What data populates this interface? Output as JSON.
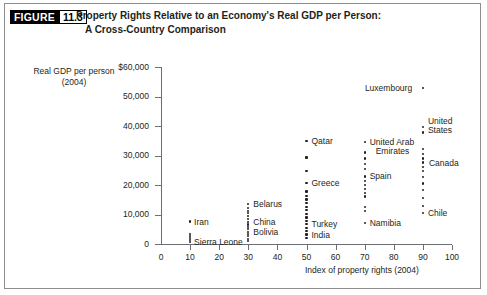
{
  "figure": {
    "tag_word": "FIGURE",
    "tag_number": "11.3",
    "title_line1": "Property Rights Relative to an Economy's Real GDP per Person:",
    "title_line2": "A Cross-Country Comparison"
  },
  "chart_data": {
    "type": "scatter",
    "title": "Property Rights Relative to an Economy's Real GDP per Person: A Cross-Country Comparison",
    "xlabel": "Index of property rights (2004)",
    "ylabel": "Real GDP per person (2004)",
    "xlim": [
      0,
      100
    ],
    "ylim": [
      0,
      60000
    ],
    "grid": false,
    "legend": "none",
    "xticks": [
      "0",
      "10",
      "20",
      "30",
      "40",
      "50",
      "60",
      "70",
      "80",
      "90",
      "100"
    ],
    "yticks": [
      "$60,000",
      "50,000",
      "40,000",
      "30,000",
      "20,000",
      "10,000",
      "0"
    ],
    "ytick_values": [
      60000,
      50000,
      40000,
      30000,
      20000,
      10000,
      0
    ],
    "xtick_values": [
      0,
      10,
      20,
      30,
      40,
      50,
      60,
      70,
      80,
      90,
      100
    ],
    "annotations": [
      {
        "label": "Iran",
        "x": 10,
        "y": 7600,
        "label_dx": 4,
        "label_dy": -4
      },
      {
        "label": "Sierra Leone",
        "x": 10,
        "y": 800,
        "label_dx": 4,
        "label_dy": -4
      },
      {
        "label": "Belarus",
        "x": 30,
        "y": 13500,
        "label_dx": 5,
        "label_dy": -4
      },
      {
        "label": "China",
        "x": 30,
        "y": 7400,
        "label_dx": 5,
        "label_dy": -4
      },
      {
        "label": "Bolivia",
        "x": 30,
        "y": 4200,
        "label_dx": 5,
        "label_dy": -4
      },
      {
        "label": "Greece",
        "x": 50,
        "y": 20700,
        "label_dx": 5,
        "label_dy": -4
      },
      {
        "label": "Turkey",
        "x": 50,
        "y": 6700,
        "label_dx": 5,
        "label_dy": -4
      },
      {
        "label": "India",
        "x": 50,
        "y": 3200,
        "label_dx": 5,
        "label_dy": -4
      },
      {
        "label": "Qatar",
        "x": 50,
        "y": 34900,
        "label_dx": 5,
        "label_dy": -4
      },
      {
        "label": "Luxembourg",
        "x": 90,
        "y": 52800,
        "label_dx": -58,
        "label_dy": -4
      },
      {
        "label": "United Arab",
        "x": 70,
        "y": 34700,
        "label_dx": 5,
        "label_dy": -4
      },
      {
        "label": "Emirates",
        "x": 70,
        "y": 34700,
        "label_dx": 11,
        "label_dy": 5
      },
      {
        "label": "Spain",
        "x": 70,
        "y": 22900,
        "label_dx": 5,
        "label_dy": -4
      },
      {
        "label": "Namibia",
        "x": 70,
        "y": 7200,
        "label_dx": 5,
        "label_dy": -4
      },
      {
        "label": "United",
        "x": 90,
        "y": 39600,
        "label_dx": 5,
        "label_dy": -10
      },
      {
        "label": "States",
        "x": 90,
        "y": 39600,
        "label_dx": 5,
        "label_dy": -1
      },
      {
        "label": "Canada",
        "x": 90,
        "y": 27600,
        "label_dx": 6,
        "label_dy": -4
      },
      {
        "label": "Chile",
        "x": 90,
        "y": 10500,
        "label_dx": 5,
        "label_dy": -4
      }
    ],
    "points": [
      {
        "x": 10,
        "y": 7600
      },
      {
        "x": 10,
        "y": 3400
      },
      {
        "x": 10,
        "y": 2700
      },
      {
        "x": 10,
        "y": 2000
      },
      {
        "x": 10,
        "y": 1400
      },
      {
        "x": 10,
        "y": 800
      },
      {
        "x": 30,
        "y": 13500
      },
      {
        "x": 30,
        "y": 12200
      },
      {
        "x": 30,
        "y": 11300
      },
      {
        "x": 30,
        "y": 10400
      },
      {
        "x": 30,
        "y": 9500
      },
      {
        "x": 30,
        "y": 8500
      },
      {
        "x": 30,
        "y": 7400
      },
      {
        "x": 30,
        "y": 6600
      },
      {
        "x": 30,
        "y": 5800
      },
      {
        "x": 30,
        "y": 5000
      },
      {
        "x": 30,
        "y": 4200
      },
      {
        "x": 30,
        "y": 3400
      },
      {
        "x": 30,
        "y": 2600
      },
      {
        "x": 30,
        "y": 1800
      },
      {
        "x": 30,
        "y": 1000
      },
      {
        "x": 50,
        "y": 34900
      },
      {
        "x": 50,
        "y": 29300
      },
      {
        "x": 50,
        "y": 24700
      },
      {
        "x": 50,
        "y": 20700
      },
      {
        "x": 50,
        "y": 17800
      },
      {
        "x": 50,
        "y": 16400
      },
      {
        "x": 50,
        "y": 15100
      },
      {
        "x": 50,
        "y": 13800
      },
      {
        "x": 50,
        "y": 12600
      },
      {
        "x": 50,
        "y": 11400
      },
      {
        "x": 50,
        "y": 10200
      },
      {
        "x": 50,
        "y": 9000
      },
      {
        "x": 50,
        "y": 7900
      },
      {
        "x": 50,
        "y": 6700
      },
      {
        "x": 50,
        "y": 5500
      },
      {
        "x": 50,
        "y": 4400
      },
      {
        "x": 50,
        "y": 3200
      },
      {
        "x": 50,
        "y": 2100
      },
      {
        "x": 70,
        "y": 34700
      },
      {
        "x": 70,
        "y": 31000
      },
      {
        "x": 70,
        "y": 29000
      },
      {
        "x": 70,
        "y": 27200
      },
      {
        "x": 70,
        "y": 25400
      },
      {
        "x": 70,
        "y": 22900
      },
      {
        "x": 70,
        "y": 21300
      },
      {
        "x": 70,
        "y": 20000
      },
      {
        "x": 70,
        "y": 18700
      },
      {
        "x": 70,
        "y": 17400
      },
      {
        "x": 70,
        "y": 16100
      },
      {
        "x": 70,
        "y": 12500
      },
      {
        "x": 70,
        "y": 11300
      },
      {
        "x": 70,
        "y": 7200
      },
      {
        "x": 90,
        "y": 52800
      },
      {
        "x": 90,
        "y": 39600
      },
      {
        "x": 90,
        "y": 37800
      },
      {
        "x": 90,
        "y": 32300
      },
      {
        "x": 90,
        "y": 30600
      },
      {
        "x": 90,
        "y": 29000
      },
      {
        "x": 90,
        "y": 27600
      },
      {
        "x": 90,
        "y": 26200
      },
      {
        "x": 90,
        "y": 24700
      },
      {
        "x": 90,
        "y": 22600
      },
      {
        "x": 90,
        "y": 20500
      },
      {
        "x": 90,
        "y": 18300
      },
      {
        "x": 90,
        "y": 15600
      },
      {
        "x": 90,
        "y": 13000
      },
      {
        "x": 90,
        "y": 10500
      }
    ]
  }
}
